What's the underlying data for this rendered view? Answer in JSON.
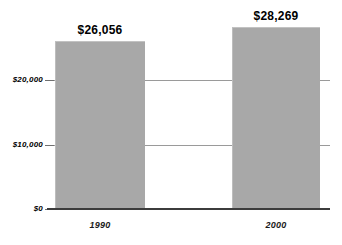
{
  "chart_data": {
    "type": "bar",
    "title": "",
    "subtitle": "",
    "xlabel": "",
    "ylabel": "",
    "categories": [
      "1990",
      "2000"
    ],
    "values": [
      26056,
      28269
    ],
    "value_labels": [
      "$26,056",
      "$28,269"
    ],
    "ytick_labels": [
      "$20,000",
      "$10,000",
      "$0"
    ],
    "ytick_values": [
      20000,
      10000,
      0
    ],
    "ylim": [
      0,
      30000
    ],
    "grid": true,
    "gridlines_at": [
      20000,
      10000
    ],
    "legend": null,
    "legend_position": "none",
    "bar_color": "#a8a8a8",
    "axis_color": "#3c3c3c",
    "gridline_color": "#9a9a9a",
    "background": "#ffffff"
  },
  "axes": {
    "y_ticks": [
      {
        "label": "$20,000",
        "value": 20000
      },
      {
        "label": "$10,000",
        "value": 10000
      },
      {
        "label": "$0",
        "value": 0
      }
    ],
    "x_ticks": [
      {
        "label": "1990"
      },
      {
        "label": "2000"
      }
    ]
  },
  "bars": [
    {
      "category": "1990",
      "value_label": "$26,056",
      "value": 26056
    },
    {
      "category": "2000",
      "value_label": "$28,269",
      "value": 28269
    }
  ]
}
